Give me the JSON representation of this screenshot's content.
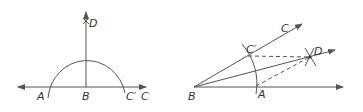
{
  "figures": [
    {
      "id": "left",
      "description": "Construct perpendicular at B: semicircle centered at B on line AC, vertical ray BD",
      "labels": {
        "A": "A",
        "B": "B",
        "C_prime": "C′",
        "C": "C",
        "D": "D"
      }
    },
    {
      "id": "right",
      "description": "Bisect angle ABC: arc centered at B cuts rays at A and C′, arcs from A and C′ meet at D, ray BD",
      "labels": {
        "A": "A",
        "B": "B",
        "C_prime": "C′",
        "C": "C",
        "D": "D"
      }
    }
  ],
  "colors": {
    "stroke": "#555555",
    "text": "#333333",
    "background": "#ffffff"
  }
}
